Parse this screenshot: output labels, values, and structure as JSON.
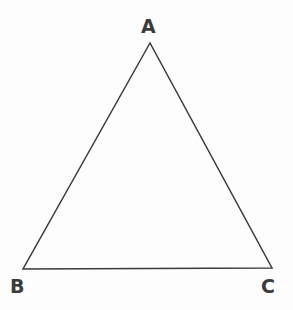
{
  "figure": {
    "name": "triangle-abc",
    "type": "geometry-diagram",
    "width": 293,
    "height": 310,
    "background_color": "#fdfdfd",
    "stroke_color": "#3a3a3a",
    "stroke_width": 1.5,
    "fill": "none"
  },
  "vertices": [
    {
      "id": "A",
      "label": "A",
      "x": 150,
      "y": 43,
      "label_x": 141,
      "label_y": 17,
      "label_position": "above"
    },
    {
      "id": "B",
      "label": "B",
      "x": 23,
      "y": 269,
      "label_x": 10,
      "label_y": 277,
      "label_position": "below-left"
    },
    {
      "id": "C",
      "label": "C",
      "x": 272,
      "y": 268,
      "label_x": 261,
      "label_y": 277,
      "label_position": "below-right"
    }
  ],
  "edges": [
    {
      "id": "AB",
      "from": "A",
      "to": "B"
    },
    {
      "id": "BC",
      "from": "B",
      "to": "C"
    },
    {
      "id": "CA",
      "from": "C",
      "to": "A"
    }
  ],
  "path": {
    "d": "M 150 43 L 23 269 L 272 268 Z"
  },
  "labels": {
    "apex": "A",
    "bottom_left": "B",
    "bottom_right": "C"
  },
  "style": {
    "label_color": "#3b3b3b",
    "label_font_size": "19px",
    "label_font_weight": "600"
  }
}
